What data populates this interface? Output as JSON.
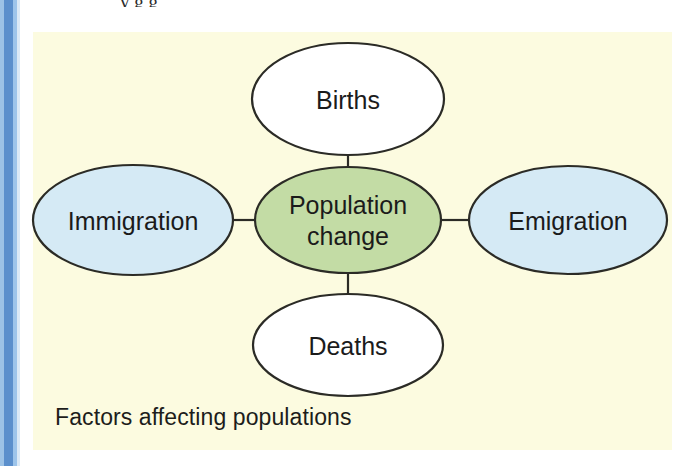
{
  "page": {
    "background_color": "#ffffff",
    "spine_colors": [
      "#9cc2e6",
      "#5b8fcc",
      "#9dc4ea",
      "#dbe9f6"
    ],
    "panel_background": "#fcfbe0",
    "cutoff_text": "y   g  g"
  },
  "diagram": {
    "caption": "Factors affecting populations",
    "outline_color": "#2b2b26",
    "nodes": [
      {
        "id": "births",
        "label": "Births",
        "fill": "#ffffff",
        "cx": 348,
        "cy": 99,
        "rx": 96,
        "ry": 56
      },
      {
        "id": "immigration",
        "label": "Immigration",
        "fill": "#d5eaf5",
        "cx": 133,
        "cy": 220,
        "rx": 100,
        "ry": 55
      },
      {
        "id": "population-change",
        "label_line1": "Population",
        "label_line2": "change",
        "fill": "#c3dca5",
        "cx": 348,
        "cy": 220,
        "rx": 93,
        "ry": 53
      },
      {
        "id": "emigration",
        "label": "Emigration",
        "fill": "#d5eaf5",
        "cx": 568,
        "cy": 220,
        "rx": 99,
        "ry": 54
      },
      {
        "id": "deaths",
        "label": "Deaths",
        "fill": "#ffffff",
        "cx": 348,
        "cy": 345,
        "rx": 95,
        "ry": 51
      }
    ],
    "connectors": [
      {
        "id": "births-to-center",
        "x1": 348,
        "y1": 155,
        "x2": 348,
        "y2": 170
      },
      {
        "id": "center-to-deaths",
        "x1": 348,
        "y1": 273,
        "x2": 348,
        "y2": 295
      },
      {
        "id": "immigration-to-center",
        "x1": 233,
        "y1": 220,
        "x2": 256,
        "y2": 220
      },
      {
        "id": "center-to-emigration",
        "x1": 441,
        "y1": 220,
        "x2": 469,
        "y2": 220
      }
    ]
  }
}
